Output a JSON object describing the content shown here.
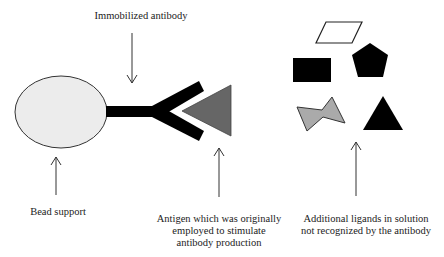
{
  "diagram": {
    "labels": {
      "immobilized_antibody": "Immobilized antibody",
      "bead_support": "Bead support",
      "antigen_line1": "Antigen which was originally",
      "antigen_line2": "employed to stimulate",
      "antigen_line3": "antibody production",
      "ligands_line1": "Additional ligands in solution",
      "ligands_line2": "not recognized by the antibody"
    },
    "colors": {
      "bead_fill": "#ececec",
      "antibody": "#000000",
      "antigen": "#666666",
      "ligand_bowtie": "#aaaaaa",
      "ligand_dark": "#000000"
    },
    "shapes": [
      "bead-ellipse",
      "antibody-y",
      "antigen-triangle",
      "parallelogram",
      "rectangle",
      "pentagon",
      "bowtie",
      "triangle"
    ]
  }
}
